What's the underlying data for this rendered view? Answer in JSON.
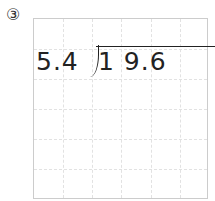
{
  "problem": {
    "number_label": "③",
    "divisor": "5.4",
    "dividend": "1 9.6",
    "operation": "long-division"
  },
  "grid": {
    "columns": 6,
    "rows": 6
  }
}
